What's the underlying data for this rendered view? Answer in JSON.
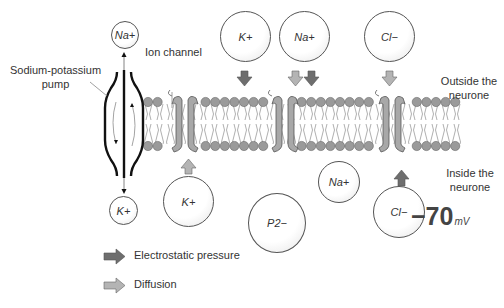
{
  "labels": {
    "pump": "Sodium-potassium\npump",
    "pump_line1": "Sodium-potassium",
    "pump_line2": "pump",
    "ion_channel": "Ion channel",
    "outside_line1": "Outside the",
    "outside_line2": "neurone",
    "inside_line1": "Inside the",
    "inside_line2": "neurone",
    "potential_value": "−70",
    "potential_unit": "mV"
  },
  "ions": {
    "pump_out": "Na+",
    "pump_in": "K+",
    "outside_k": "K+",
    "outside_na": "Na+",
    "outside_cl": "Cl−",
    "inside_k": "K+",
    "inside_p": "P2−",
    "inside_na": "Na+",
    "inside_cl": "Cl−"
  },
  "legend": {
    "electrostatic": "Electrostatic pressure",
    "diffusion": "Diffusion"
  },
  "colors": {
    "electrostatic_arrow": "#6e6e6e",
    "diffusion_arrow": "#b4b4b4",
    "head": "#9a9a9a",
    "channel": "#a8a8a8",
    "outline": "#444444"
  }
}
